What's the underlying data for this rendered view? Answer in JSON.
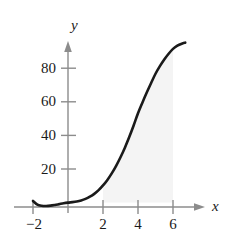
{
  "figure": {
    "background_color": "#ffffff",
    "axis_color": "#8c8c8c",
    "curve_color": "#1a1a1a",
    "shade_color": "#f4f4f4",
    "label_color": "#1a1a1a"
  },
  "axes": {
    "x_axis_name": "x",
    "y_axis_name": "y",
    "x_tick_labels": [
      "−2",
      "2",
      "4",
      "6"
    ],
    "y_tick_labels": [
      "80",
      "60",
      "40",
      "20"
    ]
  },
  "chart_data": {
    "type": "line",
    "title": "",
    "xlabel": "x",
    "ylabel": "y",
    "xlim": [
      -2.6,
      7.6
    ],
    "ylim": [
      -8,
      105
    ],
    "xticks": [
      -2,
      2,
      4,
      6
    ],
    "yticks": [
      20,
      40,
      60,
      80
    ],
    "xtick_labels": [
      "−2",
      "2",
      "4",
      "6"
    ],
    "ytick_labels": [
      "20",
      "40",
      "60",
      "80"
    ],
    "grid": false,
    "legend": null,
    "annotations": [],
    "series": [
      {
        "name": "curve",
        "x": [
          -2.0,
          -1.75,
          -1.5,
          -1.25,
          -1.0,
          -0.75,
          -0.5,
          -0.25,
          0.0,
          0.25,
          0.5,
          0.75,
          1.0,
          1.25,
          1.5,
          1.75,
          2.0,
          2.25,
          2.5,
          2.75,
          3.0,
          3.25,
          3.5,
          3.75,
          4.0,
          4.25,
          4.5,
          4.75,
          5.0,
          5.25,
          5.5,
          5.75,
          6.0,
          6.25,
          6.5,
          6.7
        ],
        "y": [
          1.0,
          -1.2,
          -1.9,
          -2.0,
          -1.8,
          -1.4,
          -0.9,
          -0.4,
          0.0,
          0.3,
          0.7,
          1.3,
          2.2,
          3.5,
          5.2,
          7.4,
          10.2,
          13.5,
          17.4,
          21.9,
          27.0,
          32.7,
          39.0,
          45.9,
          53.2,
          59.5,
          65.5,
          71.2,
          76.7,
          81.2,
          85.2,
          88.6,
          91.5,
          93.4,
          94.6,
          95.2
        ]
      }
    ],
    "shaded_region": {
      "label": "area under curve",
      "x_from": 2,
      "x_to": 6,
      "color": "#f4f4f4"
    }
  }
}
